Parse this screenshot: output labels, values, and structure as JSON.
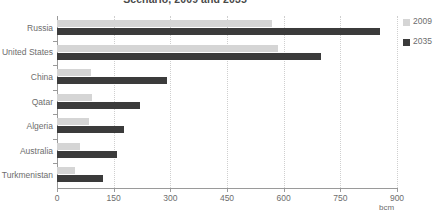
{
  "chart_data": {
    "type": "bar",
    "orientation": "horizontal",
    "title": "Scenario, 2009 and 2035",
    "xlabel": "bcm",
    "ylabel": "",
    "xlim": [
      0,
      900
    ],
    "xticks": [
      0,
      150,
      300,
      450,
      600,
      750,
      900
    ],
    "grid": true,
    "grid_axis": "x",
    "legend_position": "right",
    "categories": [
      "Russia",
      "United States",
      "China",
      "Qatar",
      "Algeria",
      "Australia",
      "Turkmenistan"
    ],
    "series": [
      {
        "name": "2009",
        "color": "#d5d5d5",
        "values": [
          570,
          585,
          90,
          93,
          85,
          60,
          48
        ]
      },
      {
        "name": "2035",
        "color": "#3b3b3b",
        "values": [
          855,
          700,
          290,
          220,
          177,
          160,
          122
        ]
      }
    ]
  },
  "axis": {
    "unit_label": "bcm",
    "tick_labels": [
      "0",
      "150",
      "300",
      "450",
      "600",
      "750",
      "900"
    ]
  },
  "legend": {
    "items": [
      {
        "label": "2009",
        "color": "#d5d5d5"
      },
      {
        "label": "2035",
        "color": "#3b3b3b"
      }
    ]
  }
}
